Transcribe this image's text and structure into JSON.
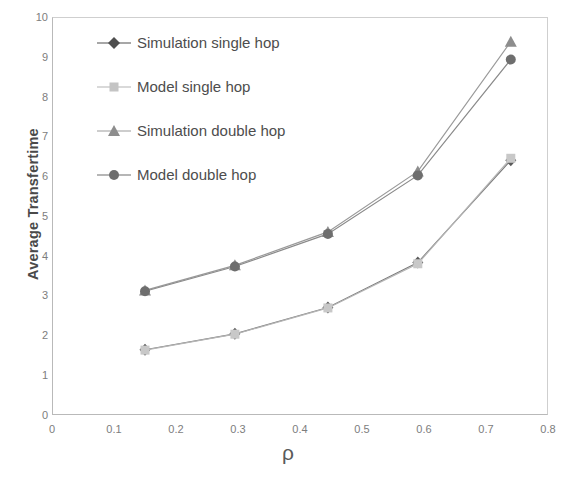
{
  "chart_data": {
    "type": "line",
    "title": "",
    "xlabel": "ρ",
    "ylabel": "Average Transfertime",
    "xlim": [
      0,
      0.8
    ],
    "ylim": [
      0,
      10
    ],
    "xticks": [
      "0",
      "0.1",
      "0.2",
      "0.3",
      "0.4",
      "0.5",
      "0.6",
      "0.7",
      "0.8"
    ],
    "xtick_values": [
      0,
      0.1,
      0.2,
      0.3,
      0.4,
      0.5,
      0.6,
      0.7,
      0.8
    ],
    "yticks": [
      "0",
      "1",
      "2",
      "3",
      "4",
      "5",
      "6",
      "7",
      "8",
      "9",
      "10"
    ],
    "ytick_values": [
      0,
      1,
      2,
      3,
      4,
      5,
      6,
      7,
      8,
      9,
      10
    ],
    "grid": false,
    "legend_position": "upper-left-inside",
    "x": [
      0.15,
      0.295,
      0.445,
      0.59,
      0.74
    ],
    "series": [
      {
        "name": "Simulation single hop",
        "marker": "diamond",
        "color": "#5a5a5a",
        "line_color": "#7a7a7a",
        "values": [
          1.64,
          2.04,
          2.7,
          3.83,
          6.4
        ]
      },
      {
        "name": "Model single hop",
        "marker": "square",
        "color": "#c8c8c8",
        "line_color": "#b5b5b5",
        "values": [
          1.63,
          2.03,
          2.69,
          3.8,
          6.45
        ]
      },
      {
        "name": "Simulation double hop",
        "marker": "triangle",
        "color": "#8d8d8d",
        "line_color": "#9a9a9a",
        "values": [
          3.13,
          3.76,
          4.6,
          6.12,
          9.38
        ]
      },
      {
        "name": "Model double hop",
        "marker": "circle",
        "color": "#6e6e6e",
        "line_color": "#8a8a8a",
        "values": [
          3.11,
          3.73,
          4.55,
          6.02,
          8.93
        ]
      }
    ]
  },
  "axis": {
    "y_title": "Average Transfertime",
    "x_title": "ρ"
  },
  "legend": {
    "items": [
      {
        "label": "Simulation single hop",
        "marker": "diamond-marker-icon",
        "color": "#5a5a5a"
      },
      {
        "label": "Model single hop",
        "marker": "square-marker-icon",
        "color": "#c8c8c8"
      },
      {
        "label": "Simulation double hop",
        "marker": "triangle-marker-icon",
        "color": "#8d8d8d"
      },
      {
        "label": "Model double hop",
        "marker": "circle-marker-icon",
        "color": "#6e6e6e"
      }
    ]
  }
}
